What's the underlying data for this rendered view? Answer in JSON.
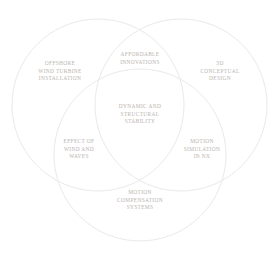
{
  "diagram": {
    "type": "venn-3",
    "background_color": "#ffffff",
    "stroke_color": "#ebe9e8",
    "text_color": "#b9b3af",
    "circles": [
      {
        "id": "left",
        "name": "offshore-wind-turbine-installation",
        "cx": 98,
        "cy": 105,
        "r": 86
      },
      {
        "id": "right",
        "name": "3d-conceptual-design",
        "cx": 181,
        "cy": 105,
        "r": 86
      },
      {
        "id": "bottom",
        "name": "motion-compensation-systems",
        "cx": 140,
        "cy": 155,
        "r": 86
      }
    ],
    "labels": {
      "left_set": "OFFSHORE\nWIND TURBINE\nINSTALLATION",
      "right_set": "3D\nCONCEPTUAL\nDESIGN",
      "bottom_set": "MOTION\nCOMPENSATION\nSYSTEMS",
      "top_intersection": "AFFORDABLE\nINNOVATIONS",
      "left_intersection": "EFFECT OF\nWIND AND\nWAVES",
      "right_intersection": "MOTION\nSIMULATION\nIN NX",
      "center_intersection": "DYNAMIC AND\nSTRUCTURAL\nSTABILITY"
    }
  }
}
